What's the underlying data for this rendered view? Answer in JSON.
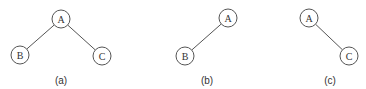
{
  "diagram": {
    "type": "binary-tree-variants",
    "trees": [
      {
        "id": "a",
        "caption": "(a)",
        "nodes": [
          {
            "id": "A",
            "label": "A"
          },
          {
            "id": "B",
            "label": "B"
          },
          {
            "id": "C",
            "label": "C"
          }
        ],
        "edges": [
          [
            "A",
            "B"
          ],
          [
            "A",
            "C"
          ]
        ]
      },
      {
        "id": "b",
        "caption": "(b)",
        "nodes": [
          {
            "id": "A",
            "label": "A"
          },
          {
            "id": "B",
            "label": "B"
          }
        ],
        "edges": [
          [
            "A",
            "B"
          ]
        ]
      },
      {
        "id": "c",
        "caption": "(c)",
        "nodes": [
          {
            "id": "A",
            "label": "A"
          },
          {
            "id": "C",
            "label": "C"
          }
        ],
        "edges": [
          [
            "A",
            "C"
          ]
        ]
      }
    ]
  }
}
